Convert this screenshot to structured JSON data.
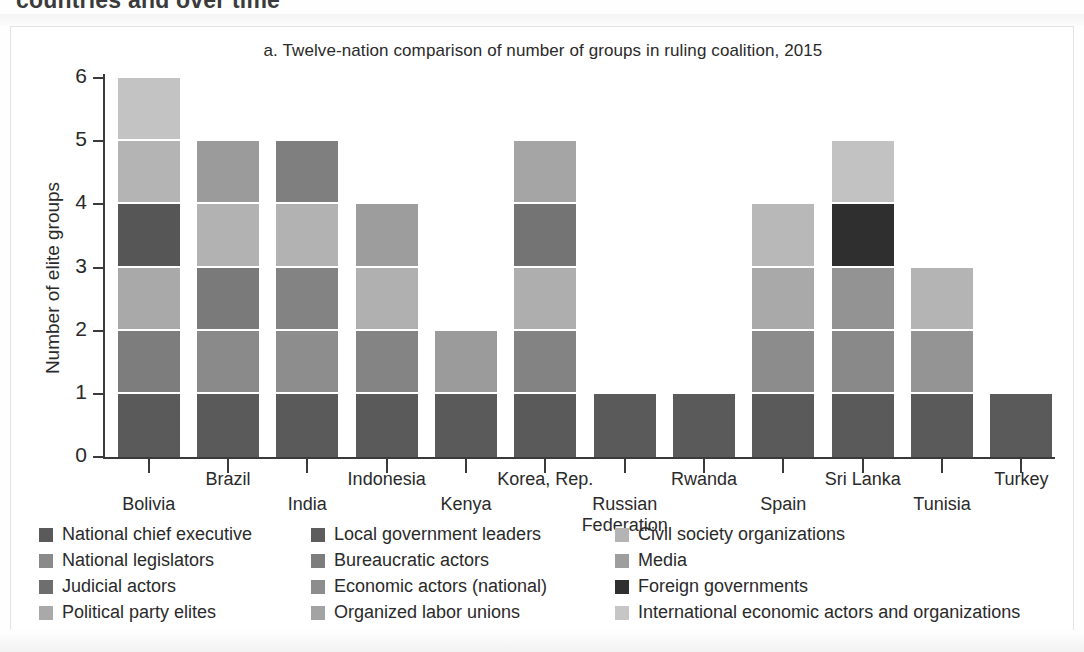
{
  "page": {
    "cut_heading": "countries and over time"
  },
  "chart_data": {
    "type": "bar",
    "subtype": "stacked-bar",
    "title": "a. Twelve-nation comparison of number of groups in ruling coalition, 2015",
    "xlabel": "",
    "ylabel": "Number of elite groups",
    "ylim": [
      0,
      6
    ],
    "yticks": [
      0,
      1,
      2,
      3,
      4,
      5,
      6
    ],
    "ytick_labels": [
      "0",
      "1",
      "2",
      "3",
      "4",
      "5",
      "6"
    ],
    "grid": false,
    "legend_position": "bottom",
    "categories": [
      "Bolivia",
      "Brazil",
      "India",
      "Indonesia",
      "Kenya",
      "Korea, Rep.",
      "Russian Federation",
      "Rwanda",
      "Spain",
      "Sri Lanka",
      "Tunisia",
      "Turkey"
    ],
    "totals": [
      6,
      5,
      5,
      4,
      2,
      5,
      1,
      1,
      4,
      5,
      3,
      1
    ],
    "series": [
      {
        "name": "National chief executive",
        "color": "#5a5a5a",
        "values": [
          1,
          1,
          1,
          1,
          1,
          1,
          1,
          1,
          1,
          1,
          1,
          1
        ]
      },
      {
        "name": "National legislators",
        "color": "#7d7d7d",
        "values": [
          1,
          1,
          1,
          1,
          1,
          1,
          0,
          0,
          1,
          1,
          1,
          0
        ]
      },
      {
        "name": "Judicial actors",
        "color": "#6e6e6e",
        "values": [
          0,
          0,
          0,
          0,
          0,
          0,
          0,
          0,
          0,
          0,
          0,
          0
        ]
      },
      {
        "name": "Political party elites",
        "color": "#a9a9a9",
        "values": [
          1,
          1,
          1,
          1,
          0,
          1,
          0,
          0,
          1,
          1,
          1,
          0
        ]
      },
      {
        "name": "Local government leaders",
        "color": "#626262",
        "values": [
          1,
          1,
          1,
          0,
          0,
          1,
          0,
          0,
          0,
          0,
          0,
          0
        ]
      },
      {
        "name": "Bureaucratic actors",
        "color": "#7a7a7a",
        "values": [
          0,
          0,
          0,
          0,
          0,
          0,
          0,
          0,
          0,
          0,
          0,
          0
        ]
      },
      {
        "name": "Economic actors (national)",
        "color": "#8d8d8d",
        "values": [
          0,
          0,
          0,
          0,
          0,
          0,
          0,
          0,
          0,
          0,
          0,
          0
        ]
      },
      {
        "name": "Organized labor unions",
        "color": "#9a9a9a",
        "values": [
          0,
          0,
          0,
          0,
          0,
          0,
          0,
          0,
          0,
          0,
          0,
          0
        ]
      },
      {
        "name": "Civil society organizations",
        "color": "#b4b4b4",
        "values": [
          1,
          1,
          1,
          1,
          0,
          1,
          0,
          0,
          1,
          0,
          0,
          0
        ]
      },
      {
        "name": "Media",
        "color": "#9e9e9e",
        "values": [
          0,
          0,
          0,
          0,
          0,
          0,
          0,
          0,
          0,
          0,
          0,
          0
        ]
      },
      {
        "name": "Foreign governments",
        "color": "#2f2f2f",
        "values": [
          0,
          0,
          0,
          0,
          0,
          0,
          0,
          0,
          0,
          1,
          0,
          0
        ]
      },
      {
        "name": "International economic actors and organizations",
        "color": "#c6c6c6",
        "values": [
          1,
          0,
          0,
          0,
          0,
          0,
          0,
          0,
          0,
          1,
          0,
          0
        ]
      }
    ],
    "bars": [
      {
        "category": "Bolivia",
        "total": 6,
        "label_row": 1,
        "segments": [
          {
            "series": "National chief executive",
            "value": 1,
            "color": "#5a5a5a"
          },
          {
            "series": "National legislators",
            "value": 1,
            "color": "#7d7d7d"
          },
          {
            "series": "Political party elites",
            "value": 1,
            "color": "#a9a9a9"
          },
          {
            "series": "Local government leaders",
            "value": 1,
            "color": "#565656"
          },
          {
            "series": "Civil society organizations",
            "value": 1,
            "color": "#b4b4b4"
          },
          {
            "series": "International economic actors and organizations",
            "value": 1,
            "color": "#c3c3c3"
          }
        ]
      },
      {
        "category": "Brazil",
        "total": 5,
        "label_row": 0,
        "segments": [
          {
            "series": "National chief executive",
            "value": 1,
            "color": "#5a5a5a"
          },
          {
            "series": "National legislators",
            "value": 1,
            "color": "#8a8a8a"
          },
          {
            "series": "Political party elites",
            "value": 1,
            "color": "#7a7a7a"
          },
          {
            "series": "Civil society organizations",
            "value": 1,
            "color": "#b2b2b2"
          },
          {
            "series": "Media",
            "value": 1,
            "color": "#9b9b9b"
          }
        ]
      },
      {
        "category": "India",
        "total": 5,
        "label_row": 1,
        "segments": [
          {
            "series": "National chief executive",
            "value": 1,
            "color": "#5a5a5a"
          },
          {
            "series": "National legislators",
            "value": 1,
            "color": "#8d8d8d"
          },
          {
            "series": "Political party elites",
            "value": 1,
            "color": "#838383"
          },
          {
            "series": "Civil society organizations",
            "value": 1,
            "color": "#b2b2b2"
          },
          {
            "series": "Media",
            "value": 1,
            "color": "#7f7f7f"
          }
        ]
      },
      {
        "category": "Indonesia",
        "total": 4,
        "label_row": 0,
        "segments": [
          {
            "series": "National chief executive",
            "value": 1,
            "color": "#5a5a5a"
          },
          {
            "series": "National legislators",
            "value": 1,
            "color": "#848484"
          },
          {
            "series": "Political party elites",
            "value": 1,
            "color": "#b0b0b0"
          },
          {
            "series": "Civil society organizations",
            "value": 1,
            "color": "#9d9d9d"
          }
        ]
      },
      {
        "category": "Kenya",
        "total": 2,
        "label_row": 1,
        "segments": [
          {
            "series": "National chief executive",
            "value": 1,
            "color": "#5a5a5a"
          },
          {
            "series": "National legislators",
            "value": 1,
            "color": "#9b9b9b"
          }
        ]
      },
      {
        "category": "Korea, Rep.",
        "total": 5,
        "label_row": 0,
        "segments": [
          {
            "series": "National chief executive",
            "value": 1,
            "color": "#5a5a5a"
          },
          {
            "series": "National legislators",
            "value": 1,
            "color": "#838383"
          },
          {
            "series": "Political party elites",
            "value": 1,
            "color": "#aeaeae"
          },
          {
            "series": "Local government leaders",
            "value": 1,
            "color": "#747474"
          },
          {
            "series": "Civil society organizations",
            "value": 1,
            "color": "#a5a5a5"
          }
        ]
      },
      {
        "category": "Russian Federation",
        "total": 1,
        "label_row": 1,
        "label_lines": [
          "Russian",
          "Federation"
        ],
        "segments": [
          {
            "series": "National chief executive",
            "value": 1,
            "color": "#5a5a5a"
          }
        ]
      },
      {
        "category": "Rwanda",
        "total": 1,
        "label_row": 0,
        "segments": [
          {
            "series": "National chief executive",
            "value": 1,
            "color": "#5a5a5a"
          }
        ]
      },
      {
        "category": "Spain",
        "total": 4,
        "label_row": 1,
        "segments": [
          {
            "series": "National chief executive",
            "value": 1,
            "color": "#5a5a5a"
          },
          {
            "series": "National legislators",
            "value": 1,
            "color": "#8c8c8c"
          },
          {
            "series": "Political party elites",
            "value": 1,
            "color": "#a9a9a9"
          },
          {
            "series": "Civil society organizations",
            "value": 1,
            "color": "#b8b8b8"
          }
        ]
      },
      {
        "category": "Sri Lanka",
        "total": 5,
        "label_row": 0,
        "segments": [
          {
            "series": "National chief executive",
            "value": 1,
            "color": "#5a5a5a"
          },
          {
            "series": "National legislators",
            "value": 1,
            "color": "#898989"
          },
          {
            "series": "Political party elites",
            "value": 1,
            "color": "#939393"
          },
          {
            "series": "Foreign governments",
            "value": 1,
            "color": "#2f2f2f"
          },
          {
            "series": "International economic actors and organizations",
            "value": 1,
            "color": "#c2c2c2"
          }
        ]
      },
      {
        "category": "Tunisia",
        "total": 3,
        "label_row": 1,
        "segments": [
          {
            "series": "National chief executive",
            "value": 1,
            "color": "#5a5a5a"
          },
          {
            "series": "National legislators",
            "value": 1,
            "color": "#949494"
          },
          {
            "series": "Political party elites",
            "value": 1,
            "color": "#b4b4b4"
          }
        ]
      },
      {
        "category": "Turkey",
        "total": 1,
        "label_row": 0,
        "segments": [
          {
            "series": "National chief executive",
            "value": 1,
            "color": "#5a5a5a"
          }
        ]
      }
    ]
  },
  "legend": {
    "columns": [
      [
        {
          "label": "National chief executive",
          "color": "#5a5a5a"
        },
        {
          "label": "National legislators",
          "color": "#8a8a8a"
        },
        {
          "label": "Judicial actors",
          "color": "#6e6e6e"
        },
        {
          "label": "Political party elites",
          "color": "#a9a9a9"
        }
      ],
      [
        {
          "label": "Local government leaders",
          "color": "#5d5d5d"
        },
        {
          "label": "Bureaucratic actors",
          "color": "#7d7d7d"
        },
        {
          "label": "Economic actors (national)",
          "color": "#8d8d8d"
        },
        {
          "label": "Organized labor unions",
          "color": "#a3a3a3"
        }
      ],
      [
        {
          "label": "Civil society organizations",
          "color": "#b4b4b4"
        },
        {
          "label": "Media",
          "color": "#9e9e9e"
        },
        {
          "label": "Foreign governments",
          "color": "#2f2f2f"
        },
        {
          "label": "International economic actors and organizations",
          "color": "#c6c6c6"
        }
      ]
    ]
  }
}
